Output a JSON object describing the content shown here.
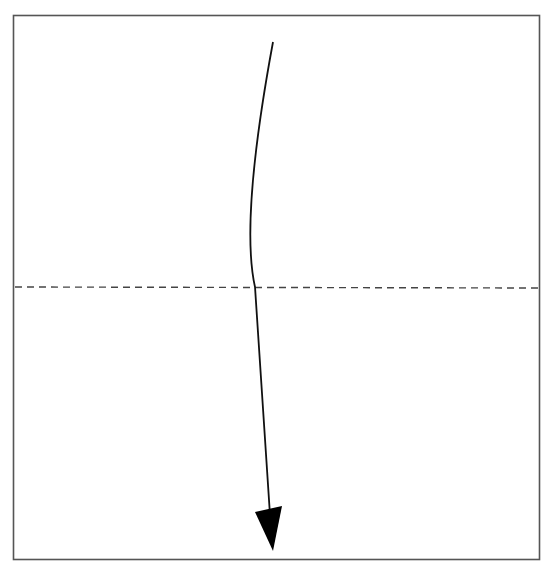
{
  "diagram": {
    "type": "origami-fold-instruction",
    "colors": {
      "background": "#ffffff",
      "paper_border": "#555555",
      "fold_line": "#444444",
      "arrow": "#111111"
    },
    "paper": {
      "x": 13,
      "y": 15,
      "width": 527,
      "height": 545
    },
    "fold_line": {
      "style": "dashed",
      "orientation": "horizontal",
      "y": 287,
      "x1": 14,
      "x2": 539,
      "label": "valley fold"
    },
    "arrow": {
      "direction": "down",
      "meaning": "fold top edge down",
      "start": {
        "x": 273,
        "y": 42
      },
      "control": {
        "x": 238,
        "y": 287
      },
      "end": {
        "x": 270,
        "y": 512
      },
      "head": {
        "tip": {
          "x": 273,
          "y": 551
        },
        "left": {
          "x": 255,
          "y": 512
        },
        "right": {
          "x": 282,
          "y": 507
        }
      }
    }
  }
}
